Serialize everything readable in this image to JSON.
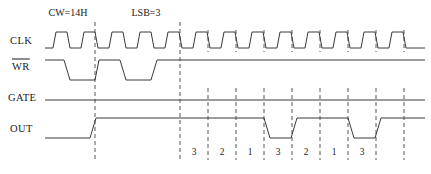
{
  "diagram": {
    "background_color": "#ffffff",
    "wave_color": "#3a3a3a",
    "marker_color": "#555555",
    "text_color": "#1a1a1a"
  },
  "annotations": [
    {
      "name": "control-word-annotation",
      "text": "CW=14H",
      "x": 68,
      "y": 16
    },
    {
      "name": "lsb-annotation",
      "text": "LSB=3",
      "x": 146,
      "y": 16
    }
  ],
  "signals": [
    {
      "name": "clk",
      "label": "CLK",
      "label_x": 10,
      "label_y": 44,
      "overbar": false
    },
    {
      "name": "wr",
      "label": "WR",
      "label_x": 12,
      "label_y": 70,
      "overbar": true
    },
    {
      "name": "gate",
      "label": "GATE",
      "label_x": 8,
      "label_y": 101,
      "overbar": false
    },
    {
      "name": "out",
      "label": "OUT",
      "label_x": 10,
      "label_y": 132,
      "overbar": false
    }
  ],
  "count_labels": [
    {
      "text": "3",
      "x": 194
    },
    {
      "text": "2",
      "x": 222
    },
    {
      "text": "1",
      "x": 250
    },
    {
      "text": "3",
      "x": 278
    },
    {
      "text": "2",
      "x": 306
    },
    {
      "text": "1",
      "x": 334
    },
    {
      "text": "3",
      "x": 362
    }
  ],
  "marker_lines": [
    {
      "x": 95,
      "y1": 22,
      "y2": 160
    },
    {
      "x": 180,
      "y1": 22,
      "y2": 160
    },
    {
      "x": 208,
      "y1": 88,
      "y2": 160
    },
    {
      "x": 236,
      "y1": 88,
      "y2": 160
    },
    {
      "x": 264,
      "y1": 88,
      "y2": 160
    },
    {
      "x": 292,
      "y1": 88,
      "y2": 160
    },
    {
      "x": 320,
      "y1": 88,
      "y2": 160
    },
    {
      "x": 348,
      "y1": 88,
      "y2": 160
    },
    {
      "x": 376,
      "y1": 88,
      "y2": 160
    },
    {
      "x": 404,
      "y1": 88,
      "y2": 160
    }
  ],
  "chart_data": {
    "type": "line",
    "xlabel": "",
    "ylabel": "",
    "x_range": [
      45,
      425
    ],
    "clock_period_px": 28,
    "clock_start_px": 53,
    "series": [
      {
        "name": "CLK",
        "high_y": 32,
        "low_y": 48,
        "description": "Free running clock, period 28 px, 14 px high / 14 px low, slight slew on edges",
        "points": "45,48 53,48 56,32 67,32 70,48 81,48 84,32 95,32 98,48 109,48 112,32 123,32 126,48 137,48 140,32 151,32 154,48 165,48 168,32 179,32 182,48 193,48 196,32 207,32 210,48 221,48 224,32 235,32 238,48 249,48 252,32 263,32 266,48 277,48 280,32 291,32 294,48 305,48 308,32 319,32 322,48 333,48 336,32 347,32 350,48 361,48 364,32 375,32 378,48 389,48 392,32 403,32 406,48 425,48"
      },
      {
        "name": "WR",
        "high_y": 60,
        "low_y": 80,
        "description": "Active-low write strobe: two low pulses then stays high",
        "points": "45,60 64,60 70,80 95,80 99,60 120,60 126,80 151,80 157,60 425,60"
      },
      {
        "name": "GATE",
        "high_y": 100,
        "low_y": 100,
        "description": "Gate held high for the full window",
        "points": "45,100 425,100"
      },
      {
        "name": "OUT",
        "high_y": 118,
        "low_y": 138,
        "description": "Output low, goes high after WR, then pulses low for one clock at each terminal count",
        "points": "45,138 90,138 96,118 264,118 270,138 291,138 297,118 348,118 354,138 375,138 381,118 425,118"
      }
    ],
    "markers_x": [
      95,
      180,
      208,
      236,
      264,
      292,
      320,
      348,
      376,
      404
    ],
    "count_sequence": [
      "3",
      "2",
      "1",
      "3",
      "2",
      "1",
      "3"
    ],
    "annotations": [
      "CW=14H",
      "LSB=3"
    ]
  }
}
